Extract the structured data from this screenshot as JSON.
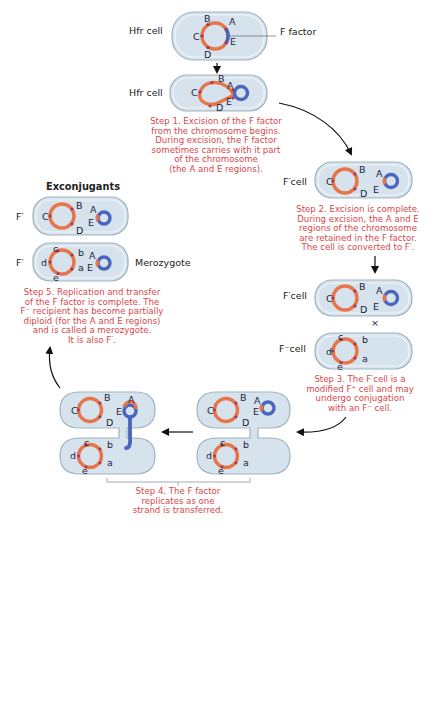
{
  "figure": {
    "exconjugants_heading": "Exconjugants",
    "f_factor_label": "F factor",
    "cross_symbol": "×"
  },
  "cell_labels": {
    "hfr_1": "Hfr cell",
    "hfr_2": "Hfr cell",
    "fprime_step2": "F′cell",
    "fprime_step3": "F′cell",
    "fminus_step3": "F⁻cell",
    "exconj_donor": "F′",
    "exconj_recipient": "F′",
    "merozygote": "Merozygote"
  },
  "gene_labels": {
    "donor": [
      "A",
      "B",
      "C",
      "D",
      "E"
    ],
    "recipient": [
      "a",
      "b",
      "c",
      "d",
      "e"
    ]
  },
  "steps": [
    {
      "id": "step1",
      "lines": [
        "Step 1. Excision of the F factor",
        "from the chromosome begins.",
        "During excision, the F factor",
        "sometimes carries with it part",
        "of the chromosome",
        "(the A and E regions)."
      ]
    },
    {
      "id": "step2",
      "lines": [
        "Step 2. Excision is complete.",
        "During excision, the A and E",
        "regions of the chromosome",
        "are retained in the F factor.",
        "The cell is converted to F′."
      ]
    },
    {
      "id": "step3",
      "lines": [
        "Step 3. The F′cell is a",
        "modified F⁺ cell and may",
        "undergo conjugation",
        "with an F⁻ cell."
      ]
    },
    {
      "id": "step4",
      "lines": [
        "Step 4. The F factor",
        "replicates as one",
        "strand is transferred."
      ]
    },
    {
      "id": "step5",
      "lines": [
        "Step 5. Replication and transfer",
        "of the F factor is complete. The",
        "F⁻ recipient has become partially",
        "diploid (for the A and E regions)",
        "and is called a merozygote.",
        "It is also F′."
      ]
    }
  ],
  "colors": {
    "chromosome": "#e8754a",
    "f_factor": "#4a64c0",
    "cell_fill": "#d6e3ec",
    "cell_stroke": "#9fb3c2",
    "step_text": "#d8474b",
    "marker": "#9a3b5c"
  }
}
